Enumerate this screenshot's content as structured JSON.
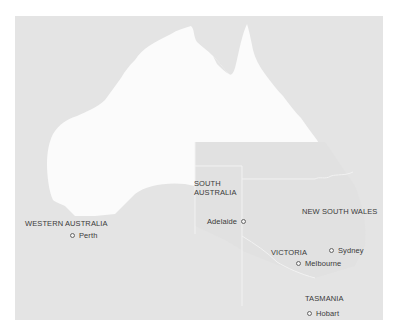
{
  "map": {
    "title": "Australia states and capital cities",
    "colors": {
      "background": "#e4e4e4",
      "highlight_land": "#fbfbfb",
      "border_lines": "#f4f4f4",
      "label_text": "#3a3a3a",
      "city_marker": "#666666"
    },
    "states": [
      {
        "name": "WESTERN AUSTRALIA",
        "label_lines": [
          "WESTERN AUSTRALIA"
        ]
      },
      {
        "name": "SOUTH AUSTRALIA",
        "label_lines": [
          "SOUTH",
          "AUSTRALIA"
        ]
      },
      {
        "name": "NEW SOUTH WALES",
        "label_lines": [
          "NEW SOUTH WALES"
        ]
      },
      {
        "name": "VICTORIA",
        "label_lines": [
          "VICTORIA"
        ]
      },
      {
        "name": "TASMANIA",
        "label_lines": [
          "TASMANIA"
        ]
      }
    ],
    "cities": [
      {
        "name": "Perth",
        "marker": "circle-marker",
        "marker_side": "left"
      },
      {
        "name": "Adelaide",
        "marker": "circle-marker",
        "marker_side": "right"
      },
      {
        "name": "Sydney",
        "marker": "circle-marker",
        "marker_side": "left"
      },
      {
        "name": "Melbourne",
        "marker": "circle-marker",
        "marker_side": "left"
      },
      {
        "name": "Hobart",
        "marker": "circle-marker",
        "marker_side": "left"
      }
    ]
  }
}
